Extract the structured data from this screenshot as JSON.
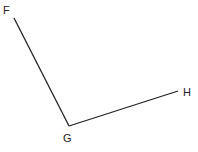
{
  "diagram": {
    "type": "angle",
    "points": {
      "F": {
        "label": "F",
        "x": 14,
        "y": 18,
        "label_x": 3,
        "label_y": 14
      },
      "G": {
        "label": "G",
        "x": 69,
        "y": 126,
        "label_x": 63,
        "label_y": 142
      },
      "H": {
        "label": "H",
        "x": 178,
        "y": 91,
        "label_x": 183,
        "label_y": 96
      }
    },
    "segments": [
      {
        "from": "F",
        "to": "G"
      },
      {
        "from": "G",
        "to": "H"
      }
    ],
    "line_color": "#222222",
    "background": "#ffffff"
  }
}
